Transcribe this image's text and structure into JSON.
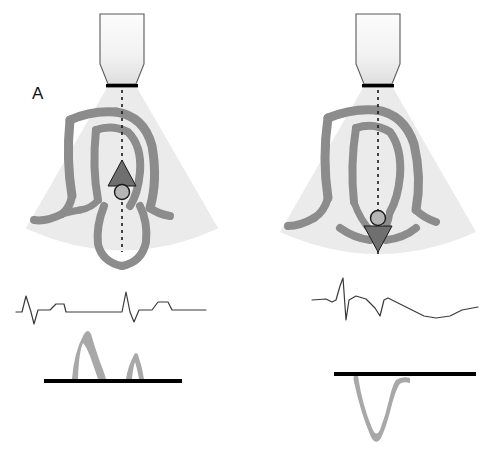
{
  "figure": {
    "width": 488,
    "height": 468,
    "background": "#ffffff"
  },
  "panels": [
    {
      "id": "A",
      "label": "A",
      "label_x": 32,
      "label_y": 84,
      "transducer": {
        "name": "ultrasound-transducer-probe",
        "face_color": "#000000",
        "body_fill_top": "#fbfbfb",
        "body_fill_bottom": "#e6e6e6",
        "outline": "#555555"
      },
      "sector": {
        "name": "ultrasound-sector-fan",
        "fill": "#ebebeb",
        "apex_x": 122,
        "apex_y": 88,
        "half_angle_deg": 33,
        "radius": 172
      },
      "anatomy": {
        "name": "heart-myocardium-outline",
        "stroke": "#8c8c8c",
        "view": "apical-four-chamber"
      },
      "scan_line": {
        "name": "doppler-scan-line",
        "style": "dashed",
        "color": "#1a1a1a",
        "x": 122,
        "y_start": 90,
        "y_end": 250
      },
      "sample_gate": {
        "name": "doppler-sample-volume-gate",
        "shape": "circle",
        "x": 122,
        "y": 190,
        "r": 7,
        "fill": "#b0b0b0",
        "stroke": "#1a1a1a"
      },
      "flow_arrow": {
        "name": "flow-direction-arrow-up",
        "direction": "up",
        "x": 122,
        "y": 172,
        "fill": "#6f6f6f",
        "stroke": "#1a1a1a",
        "meaning": "flow toward transducer"
      },
      "ecg": {
        "name": "ecg-trace",
        "color": "#3a3a3a",
        "baseline_y": 310,
        "cycles": 2
      },
      "doppler": {
        "name": "doppler-spectral-waveform",
        "polarity": "positive",
        "color": "#a8a8a8",
        "baseline_name": "doppler-baseline",
        "baseline_color": "#000000",
        "baseline_y": 381,
        "baseline_x_start": 44,
        "baseline_x_end": 182,
        "waves": [
          {
            "label": "E",
            "peak_height": 45,
            "x_center": 86,
            "width": 34
          },
          {
            "label": "A",
            "peak_height": 24,
            "x_center": 135,
            "width": 20
          }
        ]
      }
    },
    {
      "id": "B",
      "label": "B",
      "label_x": 279,
      "label_y": 84,
      "transducer": {
        "name": "ultrasound-transducer-probe",
        "face_color": "#000000",
        "body_fill_top": "#fbfbfb",
        "body_fill_bottom": "#e6e6e6",
        "outline": "#555555"
      },
      "sector": {
        "name": "ultrasound-sector-fan",
        "fill": "#ebebeb",
        "apex_x": 378,
        "apex_y": 88,
        "half_angle_deg": 33,
        "radius": 172
      },
      "anatomy": {
        "name": "heart-myocardium-outline",
        "stroke": "#8c8c8c",
        "view": "apical-five-chamber"
      },
      "scan_line": {
        "name": "doppler-scan-line",
        "style": "dashed",
        "color": "#1a1a1a",
        "x": 378,
        "y_start": 90,
        "y_end": 255
      },
      "sample_gate": {
        "name": "doppler-sample-volume-gate",
        "shape": "circle",
        "x": 378,
        "y": 216,
        "r": 7,
        "fill": "#b0b0b0",
        "stroke": "#1a1a1a"
      },
      "flow_arrow": {
        "name": "flow-direction-arrow-down",
        "direction": "down",
        "x": 378,
        "y": 238,
        "fill": "#6f6f6f",
        "stroke": "#1a1a1a",
        "meaning": "flow away from transducer"
      },
      "ecg": {
        "name": "ecg-trace",
        "color": "#3a3a3a",
        "baseline_y": 300,
        "cycles": 1
      },
      "doppler": {
        "name": "doppler-spectral-waveform",
        "polarity": "negative",
        "color": "#a8a8a8",
        "baseline_name": "doppler-baseline",
        "baseline_color": "#000000",
        "baseline_y": 374,
        "baseline_x_start": 334,
        "baseline_x_end": 476,
        "waves": [
          {
            "label": "V",
            "peak_depth": 62,
            "x_center": 372,
            "width": 30
          }
        ]
      }
    }
  ],
  "caption": {
    "text": "",
    "visible_fragment": ""
  },
  "colors": {
    "fan": "#ebebeb",
    "myocardium": "#8c8c8c",
    "doppler_signal": "#a8a8a8",
    "ecg": "#3a3a3a",
    "baseline": "#000000",
    "label_text": "#111111"
  }
}
